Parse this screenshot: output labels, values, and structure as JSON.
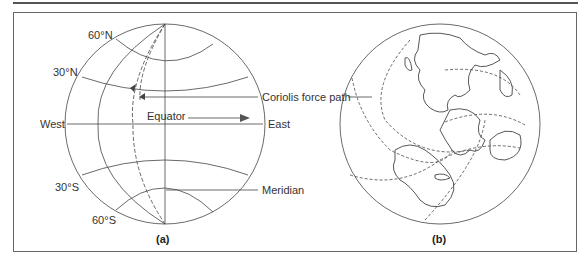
{
  "figure": {
    "panel_a": {
      "caption": "(a)",
      "labels": {
        "lat_60n": "60°N",
        "lat_30n": "30°N",
        "lat_30s": "30°S",
        "lat_60s": "60°S",
        "west": "West",
        "east": "East",
        "equator": "Equator",
        "coriolis": "Coriolis force path",
        "meridian": "Meridian"
      }
    },
    "panel_b": {
      "caption": "(b)"
    }
  }
}
